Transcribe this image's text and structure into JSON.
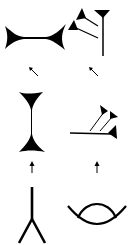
{
  "diagram": {
    "type": "sign-evolution",
    "columns": [
      {
        "id": "left",
        "stages": [
          "pictograph-legs",
          "rotated-wedge-vertical",
          "wedge-horizontal"
        ],
        "arrows": [
          "up",
          "up-left"
        ]
      },
      {
        "id": "right",
        "stages": [
          "pictograph-eye-arc",
          "wedge-cluster-horizontal",
          "wedge-cluster-vertical"
        ],
        "arrows": [
          "up",
          "up-left"
        ]
      }
    ],
    "colors": {
      "ink": "#000000",
      "background": "#ffffff"
    }
  }
}
